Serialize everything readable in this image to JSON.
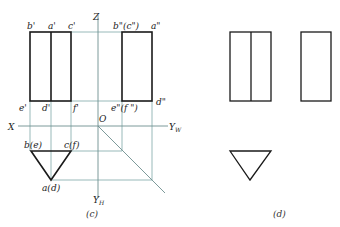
{
  "figure_c": {
    "caption": "(c)",
    "axes": {
      "z": "Z",
      "x": "X",
      "origin": "O",
      "yw": "Y",
      "yw_sub": "W",
      "yh": "Y",
      "yh_sub": "H"
    },
    "front_view_labels": {
      "b": "b'",
      "a": "a'",
      "c": "c'",
      "e": "e'",
      "d": "d'",
      "f": "f'"
    },
    "side_view_labels": {
      "bc": "b\"(c\")",
      "a": "a\"",
      "ef": "e\"(f \")",
      "d": "d\""
    },
    "top_view_labels": {
      "be": "b(e)",
      "cf": "c(f)",
      "ad": "a(d)"
    }
  },
  "figure_d": {
    "caption": "(d)"
  },
  "colors": {
    "projection_line": "#7fa7a7",
    "outline": "#1a1a1a"
  }
}
